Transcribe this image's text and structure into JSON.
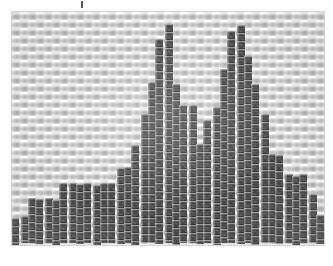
{
  "page": {
    "background_color": "#ffffff",
    "width": 333,
    "height": 266
  },
  "top_mark": {
    "label": "",
    "color": "#3a3a3a"
  },
  "picture": {
    "title": "",
    "medium": "cross-stitch embroidery on woven canvas",
    "frame_border_color": "#d2d2d2",
    "canvas_color": "#e6e6e6",
    "thread_color": "#2b2b2b",
    "weave_period_px": 8
  },
  "chart_data": {
    "type": "bar",
    "title": "",
    "subtitle": "",
    "xlabel": "",
    "ylabel": "",
    "grid": false,
    "legend": null,
    "xlim": [
      0,
      39
    ],
    "ylim": [
      0,
      100
    ],
    "note": "Stitched histogram: low-left plateau rising to a double peak near centre, then a descending staircase to the right.",
    "categories": [
      "1",
      "2",
      "3",
      "4",
      "5",
      "6",
      "7",
      "8",
      "9",
      "10",
      "11",
      "12",
      "13",
      "14",
      "15",
      "16",
      "17",
      "18",
      "19",
      "20",
      "21",
      "22",
      "23",
      "24",
      "25",
      "26",
      "27",
      "28",
      "29",
      "30",
      "31",
      "32",
      "33",
      "34",
      "35",
      "36",
      "37",
      "38",
      "39"
    ],
    "values": [
      12,
      12,
      20,
      20,
      20,
      20,
      27,
      27,
      27,
      27,
      27,
      27,
      27,
      34,
      34,
      45,
      58,
      72,
      92,
      98,
      72,
      62,
      62,
      45,
      55,
      62,
      78,
      95,
      98,
      84,
      72,
      58,
      40,
      40,
      31,
      31,
      31,
      22,
      13
    ]
  }
}
